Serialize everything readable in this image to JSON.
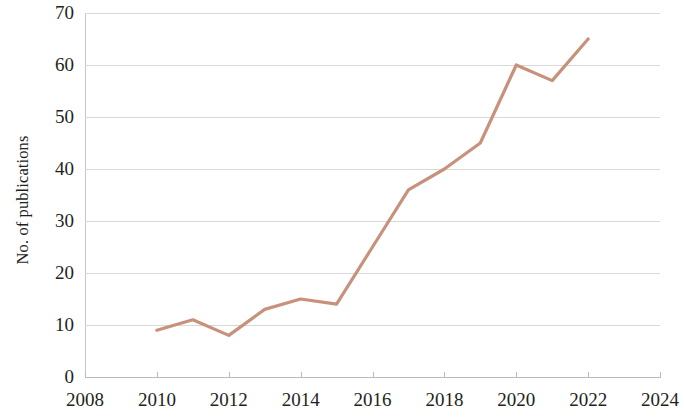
{
  "chart_data": {
    "type": "line",
    "title": "",
    "xlabel": "",
    "ylabel": "No. of publications",
    "xlim": [
      2008,
      2024
    ],
    "ylim": [
      0,
      70
    ],
    "xticks": [
      2008,
      2010,
      2012,
      2014,
      2016,
      2018,
      2020,
      2022,
      2024
    ],
    "yticks": [
      0,
      10,
      20,
      30,
      40,
      50,
      60,
      70
    ],
    "xtick_labels": [
      "2008",
      "2010",
      "2012",
      "2014",
      "2016",
      "2018",
      "2020",
      "2022",
      "2024"
    ],
    "ytick_labels": [
      "0",
      "10",
      "20",
      "30",
      "40",
      "50",
      "60",
      "70"
    ],
    "grid": "horizontal",
    "legend": null,
    "series": [
      {
        "name": "No. of publications",
        "color": "#c8917c",
        "x": [
          2010,
          2011,
          2012,
          2013,
          2014,
          2015,
          2016,
          2017,
          2018,
          2019,
          2020,
          2021,
          2022
        ],
        "values": [
          9,
          11,
          8,
          13,
          15,
          14,
          25,
          36,
          40,
          45,
          60,
          57,
          65
        ]
      }
    ]
  },
  "axis": {
    "y_title": "No. of publications"
  },
  "colors": {
    "line": "#c8917c",
    "grid": "#d8d9db",
    "axis": "#b9babd",
    "text": "#231f20",
    "background": "#ffffff"
  }
}
